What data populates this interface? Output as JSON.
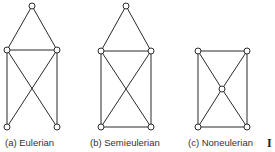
{
  "graphs": [
    {
      "id": "a",
      "caption": "(a)  Eulerian",
      "vertices": {
        "top": [
          32,
          6
        ],
        "ml": [
          7,
          50
        ],
        "mr": [
          57,
          50
        ],
        "bl": [
          7,
          127
        ],
        "br": [
          57,
          127
        ]
      },
      "edges": [
        [
          "top",
          "ml"
        ],
        [
          "top",
          "mr"
        ],
        [
          "ml",
          "mr"
        ],
        [
          "ml",
          "bl"
        ],
        [
          "mr",
          "br"
        ],
        [
          "ml",
          "br"
        ],
        [
          "mr",
          "bl"
        ]
      ]
    },
    {
      "id": "b",
      "caption": "(b)  Semieulerian",
      "vertices": {
        "top": [
          126,
          6
        ],
        "ml": [
          101,
          51
        ],
        "mr": [
          151,
          51
        ],
        "bl": [
          101,
          127
        ],
        "br": [
          151,
          127
        ]
      },
      "edges": [
        [
          "top",
          "ml"
        ],
        [
          "top",
          "mr"
        ],
        [
          "ml",
          "mr"
        ],
        [
          "ml",
          "bl"
        ],
        [
          "mr",
          "br"
        ],
        [
          "ml",
          "br"
        ],
        [
          "mr",
          "bl"
        ],
        [
          "bl",
          "br"
        ]
      ]
    },
    {
      "id": "c",
      "caption": "(c)  Noneulerian",
      "vertices": {
        "tl": [
          198,
          51
        ],
        "tr": [
          247,
          51
        ],
        "c": [
          222,
          89
        ],
        "bl": [
          198,
          127
        ],
        "br": [
          247,
          127
        ]
      },
      "edges": [
        [
          "tl",
          "tr"
        ],
        [
          "tl",
          "bl"
        ],
        [
          "tr",
          "br"
        ],
        [
          "bl",
          "br"
        ],
        [
          "tl",
          "c"
        ],
        [
          "c",
          "br"
        ],
        [
          "tr",
          "c"
        ],
        [
          "c",
          "bl"
        ]
      ]
    }
  ],
  "clipped_text": "I"
}
